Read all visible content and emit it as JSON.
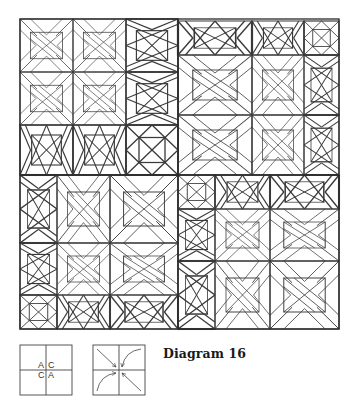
{
  "figure": {
    "caption": "Diagram 16",
    "line_color": "#3a3a3a",
    "background": "#ffffff"
  },
  "quilt": {
    "bounds": {
      "x": 20,
      "y": 19,
      "width": 319,
      "height": 310
    },
    "quadrants": [
      {
        "name": "top-left",
        "orientation": "big-blocks-left-top"
      },
      {
        "name": "top-right",
        "orientation": "big-blocks-right-bottom"
      },
      {
        "name": "bottom-left",
        "orientation": "big-blocks-right-top"
      },
      {
        "name": "bottom-right",
        "orientation": "big-blocks-right-bottom"
      }
    ]
  },
  "key_diagrams": [
    {
      "name": "placement-key",
      "labels": [
        [
          "A",
          "C"
        ],
        [
          "C",
          "A"
        ]
      ]
    },
    {
      "name": "rotation-key",
      "arrows": [
        "top-left straight to center",
        "top-right curved to center",
        "bottom-left curved to center",
        "bottom-right straight to center"
      ]
    }
  ]
}
